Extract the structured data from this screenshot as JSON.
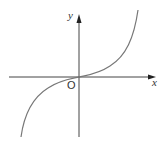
{
  "diagram": {
    "type": "function-graph",
    "axes": {
      "x_label": "x",
      "y_label": "y",
      "origin_label": "O"
    },
    "colors": {
      "axis": "#333333",
      "curve": "#777777",
      "text": "#333333",
      "background": "#ffffff"
    }
  }
}
